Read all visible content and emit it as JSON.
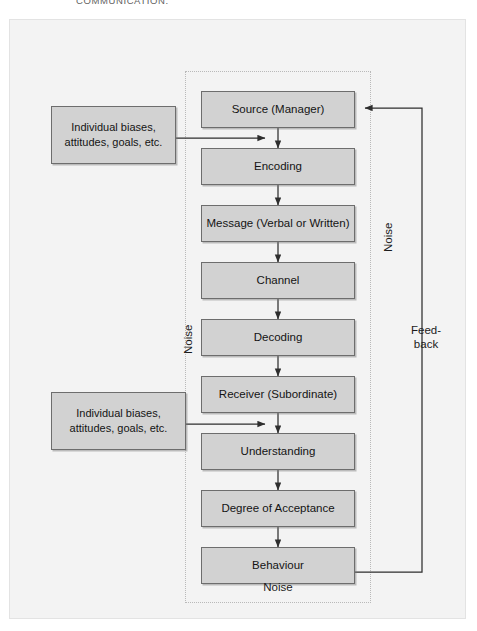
{
  "caption": "COMMUNICATION.",
  "colors": {
    "page_background": "#ffffff",
    "plate_background": "#f3f3f3",
    "node_fill": "#d2d2d2",
    "node_stroke": "#6d6d6d",
    "wire": "#3a3a3a",
    "dotted_envelope": "#b9b9b9"
  },
  "flow": {
    "nodes": [
      {
        "id": "source",
        "label": "Source (Manager)"
      },
      {
        "id": "encoding",
        "label": "Encoding"
      },
      {
        "id": "message",
        "label": "Message (Verbal or Written)"
      },
      {
        "id": "channel",
        "label": "Channel"
      },
      {
        "id": "decoding",
        "label": "Decoding"
      },
      {
        "id": "receiver",
        "label": "Receiver (Subordinate)"
      },
      {
        "id": "understanding",
        "label": "Understanding"
      },
      {
        "id": "acceptance",
        "label": "Degree of Acceptance"
      },
      {
        "id": "behaviour",
        "label": "Behaviour"
      }
    ]
  },
  "side_notes": [
    {
      "id": "note-top",
      "label": "Individual biases, attitudes, goals, etc."
    },
    {
      "id": "note-bottom",
      "label": "Individual biases, attitudes, goals, etc."
    }
  ],
  "annotations": {
    "noise_right": "Noise",
    "noise_left": "Noise",
    "noise_bottom": "Noise",
    "feedback_line1": "Feed-",
    "feedback_line2": "back"
  }
}
